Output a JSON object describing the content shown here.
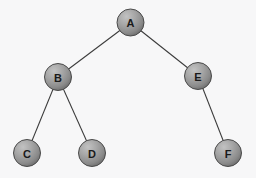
{
  "figure": {
    "background_color": "#f7f7f8",
    "width": 256,
    "height": 178
  },
  "diagram": {
    "type": "binary-tree",
    "node_radius": 13.5,
    "node_fill_light": "#b4b4b4",
    "node_fill_mid": "#9a9a9a",
    "node_fill_dark": "#6f6f6f",
    "node_stroke": "#4a4a4a",
    "edge_color": "#3a3a3a",
    "label_color": "#1a1a1a",
    "nodes": [
      {
        "id": "A",
        "label": "A",
        "cx": 130.5,
        "cy": 22.5,
        "level": 0
      },
      {
        "id": "B",
        "label": "B",
        "cx": 58.0,
        "cy": 77.0,
        "level": 1
      },
      {
        "id": "E",
        "label": "E",
        "cx": 198.0,
        "cy": 76.0,
        "level": 1
      },
      {
        "id": "C",
        "label": "C",
        "cx": 27.0,
        "cy": 153.0,
        "level": 2
      },
      {
        "id": "D",
        "label": "D",
        "cx": 92.0,
        "cy": 153.0,
        "level": 2
      },
      {
        "id": "F",
        "label": "F",
        "cx": 228.0,
        "cy": 153.0,
        "level": 2
      }
    ],
    "edges": [
      {
        "from": "A",
        "to": "B",
        "x1": 130.5,
        "y1": 22.5,
        "x2": 58.0,
        "y2": 77.0
      },
      {
        "from": "A",
        "to": "E",
        "x1": 130.5,
        "y1": 22.5,
        "x2": 198.0,
        "y2": 76.0
      },
      {
        "from": "B",
        "to": "C",
        "x1": 58.0,
        "y1": 77.0,
        "x2": 27.0,
        "y2": 153.0
      },
      {
        "from": "B",
        "to": "D",
        "x1": 58.0,
        "y1": 77.0,
        "x2": 92.0,
        "y2": 153.0
      },
      {
        "from": "E",
        "to": "F",
        "x1": 198.0,
        "y1": 76.0,
        "x2": 228.0,
        "y2": 153.0
      }
    ]
  }
}
